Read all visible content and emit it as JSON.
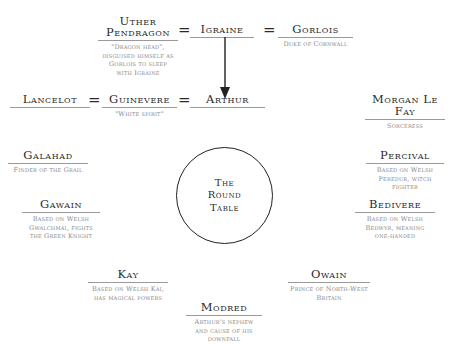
{
  "diagram": {
    "top_row": {
      "uther": {
        "name": "Uther Pendragon",
        "name_line1": "Uther",
        "name_line2": "Pendragon",
        "desc": [
          "\"Dragon head\",",
          "disguised himself as",
          "Gorlois to sleep",
          "with Igraine"
        ]
      },
      "igraine": {
        "name": "Igraine",
        "desc": []
      },
      "gorlois": {
        "name": "Gorlois",
        "desc": [
          "Duke of Cornwall"
        ]
      },
      "marriage_symbol": "="
    },
    "second_row": {
      "lancelot": {
        "name": "Lancelot",
        "desc": []
      },
      "guinevere": {
        "name": "Guinevere",
        "desc": [
          "\"White spirit\""
        ]
      },
      "arthur": {
        "name": "Arthur",
        "desc": []
      },
      "morgan": {
        "name": "Morgan Le Fay",
        "desc": [
          "Sorceress"
        ]
      },
      "marriage_symbol": "="
    },
    "center": {
      "label": "The\nRound\nTable"
    },
    "knights": {
      "galahad": {
        "name": "Galahad",
        "desc": [
          "Finder of the Grail"
        ]
      },
      "percival": {
        "name": "Percival",
        "desc": [
          "Based on Welsh",
          "Peredur, witch",
          "fighter"
        ]
      },
      "gawain": {
        "name": "Gawain",
        "desc": [
          "Based on Welsh",
          "Gwalchmai, fights",
          "the Green Knight"
        ]
      },
      "bedivere": {
        "name": "Bedivere",
        "desc": [
          "Based on Welsh",
          "Bedwyr, meaning",
          "one-handed"
        ]
      },
      "kay": {
        "name": "Kay",
        "desc": [
          "Based on Welsh Kai,",
          "has magical powers"
        ]
      },
      "owain": {
        "name": "Owain",
        "desc": [
          "Prince of North-West",
          "Britain"
        ]
      },
      "modred": {
        "name": "Modred",
        "desc": [
          "Arthur's nephew",
          "and cause of his",
          "downfall"
        ]
      }
    },
    "colors": {
      "text": "#2a2a2a",
      "desc_text": "#8a8a8a",
      "rule": "#9a9a9a",
      "line": "#222222"
    }
  }
}
